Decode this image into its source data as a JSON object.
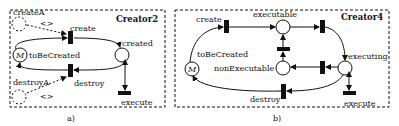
{
  "panel_a": {
    "title": "Creator2",
    "caption": "a)",
    "places": {
      "createA": "createA",
      "destroyA": "destroyA",
      "toBeCreated": "toBeCreated",
      "created": "created",
      "marking": "M"
    },
    "transitions": {
      "create": "create",
      "destroy": "destroy",
      "execute": "execute"
    },
    "annotations": {
      "create_arrow": "<>",
      "destroy_arrow": "<>"
    }
  },
  "panel_b": {
    "title": "Creator4",
    "caption": "b)",
    "places": {
      "toBeCreated": "toBeCreated",
      "executable": "executable",
      "nonExecutable": "nonExecutable",
      "executing": "executing",
      "marking": "M"
    },
    "transitions": {
      "create": "create",
      "destroy": "destroy",
      "execute": "execute"
    }
  }
}
